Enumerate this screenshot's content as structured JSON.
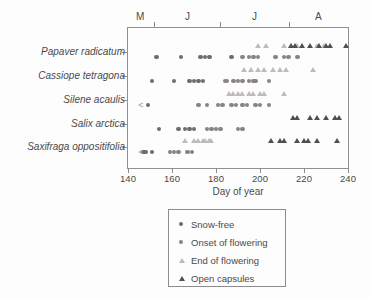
{
  "chart_data": {
    "type": "scatter",
    "title": "",
    "xlabel": "Day of year",
    "xlim": [
      140,
      240
    ],
    "x_ticks": [
      140,
      160,
      180,
      200,
      220,
      240
    ],
    "grid": false,
    "legend_position": "bottom",
    "month_axis": {
      "labels": [
        {
          "label": "M",
          "day": 145.5
        },
        {
          "label": "J",
          "day": 167
        },
        {
          "label": "J",
          "day": 197.5
        },
        {
          "label": "A",
          "day": 226.5
        }
      ],
      "boundary_ticks_day": [
        152,
        182,
        213
      ]
    },
    "species": [
      {
        "name": "Papaver radicatum",
        "snow_free": [
          153,
          164,
          173,
          175,
          177,
          187
        ],
        "onset_of_flowering": [
          192,
          195,
          197,
          199,
          207,
          211,
          213,
          217
        ],
        "end_of_flowering": [
          199,
          203,
          211,
          214,
          217,
          226,
          229
        ],
        "open_capsules": [
          214,
          216,
          219,
          223,
          227,
          230,
          232,
          239
        ]
      },
      {
        "name": "Cassiope tetragona",
        "snow_free": [
          151,
          161,
          168,
          170,
          172,
          174
        ],
        "onset_of_flowering": [
          184,
          185,
          188,
          190,
          192,
          195,
          197,
          198,
          204
        ],
        "end_of_flowering": [
          193,
          196,
          199,
          202,
          206,
          209,
          212,
          224
        ],
        "open_capsules": []
      },
      {
        "name": "Silene acaulis",
        "snow_free": [
          149
        ],
        "onset_of_flowering": [
          172,
          176,
          181,
          183,
          187,
          189,
          192,
          194,
          198,
          200,
          204
        ],
        "end_of_flowering": [
          186,
          188,
          190,
          192,
          195,
          197,
          200,
          202,
          211
        ],
        "open_capsules": []
      },
      {
        "name": "Salix arctica",
        "snow_free": [
          154,
          163,
          166,
          168,
          170
        ],
        "onset_of_flowering": [
          176,
          178,
          180,
          182,
          190,
          192
        ],
        "end_of_flowering": [],
        "open_capsules": [
          215,
          217,
          223,
          226,
          230,
          234,
          236
        ]
      },
      {
        "name": "Saxifraga oppositifolia",
        "snow_free": [
          147,
          148,
          151
        ],
        "onset_of_flowering": [
          159,
          161,
          163,
          167,
          169
        ],
        "end_of_flowering": [
          166,
          170,
          172,
          174,
          175,
          177,
          178
        ],
        "open_capsules": [
          205,
          209,
          211,
          217,
          220,
          222,
          226,
          235
        ]
      }
    ],
    "censored_markers": [
      {
        "species": "Silene acaulis",
        "symbol": "<",
        "day": 146
      },
      {
        "species": "Saxifraga oppositifolia",
        "symbol": "<",
        "day": 146
      }
    ],
    "legend": [
      {
        "label": "Snow-free",
        "marker": "circle",
        "color": "#6d6d6d"
      },
      {
        "label": "Onset of flowering",
        "marker": "circle",
        "color": "#8a8383"
      },
      {
        "label": "End of flowering",
        "marker": "triangle",
        "color": "#c0bbbb"
      },
      {
        "label": "Open capsules",
        "marker": "triangle",
        "color": "#4f4f4f"
      }
    ],
    "colors": {
      "axis": "#8c8c8c",
      "text": "#4a4a4a",
      "background": "#fdfdfd"
    }
  }
}
